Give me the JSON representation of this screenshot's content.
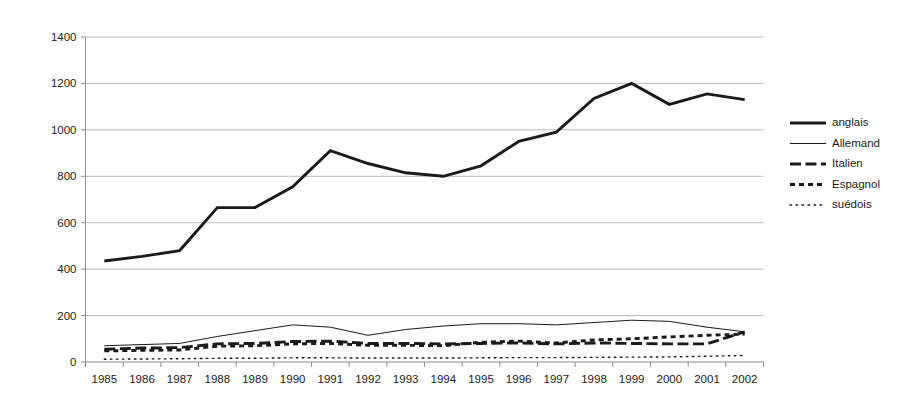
{
  "chart_data": {
    "type": "line",
    "title": "",
    "subtitle": "",
    "xlabel": "",
    "ylabel": "",
    "grid": "horizontal",
    "legend_position": "right",
    "xlim": [
      1985,
      2002
    ],
    "ylim": [
      0,
      1400
    ],
    "y_ticks": [
      0,
      200,
      400,
      600,
      800,
      1000,
      1200,
      1400
    ],
    "y_tick_labels": [
      "0",
      "200",
      "400",
      "600",
      "800",
      "1000",
      "1200",
      "1400"
    ],
    "categories": [
      1985,
      1986,
      1987,
      1988,
      1989,
      1990,
      1991,
      1992,
      1993,
      1994,
      1995,
      1996,
      1997,
      1998,
      1999,
      2000,
      2001,
      2002
    ],
    "x_tick_labels": [
      "1985",
      "1986",
      "1987",
      "1988",
      "1989",
      "1990",
      "1991",
      "1992",
      "1993",
      "1994",
      "1995",
      "1996",
      "1997",
      "1998",
      "1999",
      "2000",
      "2001",
      "2002"
    ],
    "series": [
      {
        "name": "anglais",
        "style": "solid",
        "width": 2.9,
        "color": "#1a1a1a",
        "values": [
          435,
          455,
          480,
          665,
          665,
          755,
          910,
          855,
          815,
          800,
          845,
          950,
          990,
          1135,
          1200,
          1110,
          1155,
          1130
        ]
      },
      {
        "name": "Allemand",
        "style": "solid",
        "width": 1.0,
        "color": "#1a1a1a",
        "values": [
          70,
          75,
          80,
          110,
          135,
          160,
          150,
          115,
          140,
          155,
          165,
          165,
          160,
          170,
          180,
          175,
          150,
          130
        ]
      },
      {
        "name": "Italien",
        "style": "dashed",
        "width": 2.9,
        "color": "#1a1a1a",
        "values": [
          55,
          60,
          62,
          78,
          80,
          88,
          90,
          80,
          80,
          78,
          80,
          82,
          78,
          82,
          80,
          78,
          78,
          130
        ]
      },
      {
        "name": "Espagnol",
        "style": "dotted-thick",
        "width": 2.9,
        "color": "#1a1a1a",
        "values": [
          48,
          50,
          52,
          68,
          70,
          78,
          80,
          72,
          72,
          70,
          85,
          90,
          82,
          95,
          100,
          108,
          115,
          120
        ]
      },
      {
        "name": "suédois",
        "style": "dotted-thin",
        "width": 1.4,
        "color": "#1a1a1a",
        "values": [
          12,
          13,
          14,
          16,
          16,
          18,
          18,
          17,
          17,
          17,
          18,
          19,
          19,
          20,
          21,
          22,
          25,
          28
        ]
      }
    ]
  },
  "legend": {
    "entries": [
      {
        "label": "anglais"
      },
      {
        "label": "Allemand"
      },
      {
        "label": "Italien"
      },
      {
        "label": "Espagnol"
      },
      {
        "label": "suédois"
      }
    ]
  },
  "colors": {
    "ink": "#1a1a1a",
    "gridline": "#b3b3b3",
    "axis": "#8c8c8c",
    "background": "#ffffff"
  }
}
